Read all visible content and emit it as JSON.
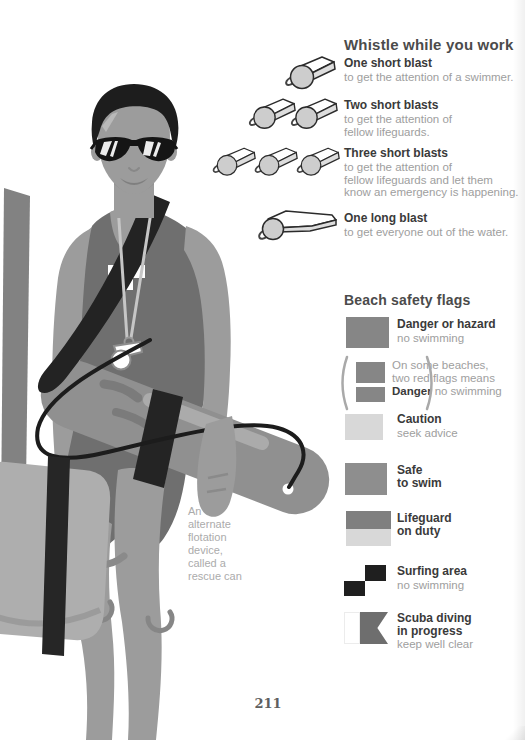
{
  "page": {
    "number": "211"
  },
  "whistles": {
    "title": "Whistle while you work",
    "entries": [
      {
        "blasts": "1 short",
        "title": "One short blast",
        "desc": "to get the attention of a swimmer."
      },
      {
        "blasts": "2 short",
        "title": "Two short blasts",
        "desc": [
          "to get the attention of",
          "fellow lifeguards."
        ]
      },
      {
        "blasts": "3 short",
        "title": "Three short blasts",
        "desc": [
          "to get the attention of",
          "fellow lifeguards and let them",
          "know an emergency is happening."
        ]
      },
      {
        "blasts": "1 long",
        "title": "One long blast",
        "desc": "to get everyone out of the water."
      }
    ]
  },
  "flags": {
    "title": "Beach safety flags",
    "items": [
      {
        "id": "danger",
        "title": "Danger or hazard",
        "note": "no swimming",
        "color": "#868686"
      },
      {
        "id": "double-red",
        "note_lines": [
          "On some beaches,",
          "two red flags means"
        ],
        "bold": "Danger",
        "bold_note": "no swimming",
        "color": "#868686"
      },
      {
        "id": "caution",
        "title": "Caution",
        "note": "seek advice",
        "color": "#d8d8d8"
      },
      {
        "id": "safe",
        "title": [
          "Safe",
          "to swim"
        ],
        "color": "#8e8e8e"
      },
      {
        "id": "lifeguard",
        "title": [
          "Lifeguard",
          "on duty"
        ],
        "color_top": "#7f7f7f",
        "color_bottom": "#d8d8d8"
      },
      {
        "id": "surfing",
        "title": "Surfing area",
        "note": "no swimming",
        "color_dark": "#1f1f1f",
        "color_light": "#ffffff"
      },
      {
        "id": "scuba",
        "title": [
          "Scuba diving",
          "in progress"
        ],
        "note": "keep well clear",
        "color": "#6e6e6e",
        "color_light": "#ffffff"
      }
    ]
  },
  "illustration": {
    "caption": [
      "An",
      "alternate",
      "flotation",
      "device,",
      "called a",
      "rescue can"
    ]
  }
}
